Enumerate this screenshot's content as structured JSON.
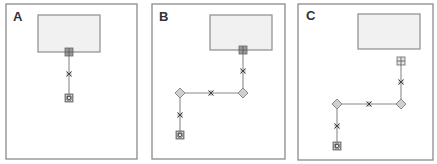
{
  "figure": {
    "panels": [
      {
        "label": "A",
        "description": "Shape with a single straight vertical connector",
        "border": {
          "x": 6,
          "y": 4,
          "w": 131,
          "h": 155
        },
        "shape": {
          "x": 38,
          "y": 15,
          "w": 62,
          "h": 37
        },
        "connector": {
          "start_handle": {
            "type": "grid-square",
            "x": 69,
            "y": 52
          },
          "waypoints": [],
          "midpoint_handles": [
            {
              "type": "x-mark",
              "x": 69,
              "y": 74
            }
          ],
          "end_handle": {
            "type": "target-square",
            "x": 69,
            "y": 98
          },
          "path": [
            [
              69,
              52
            ],
            [
              69,
              98
            ]
          ]
        }
      },
      {
        "label": "B",
        "description": "Connector rerouted with two bend points (elbow)",
        "border": {
          "x": 152,
          "y": 4,
          "w": 133,
          "h": 155
        },
        "shape": {
          "x": 210,
          "y": 15,
          "w": 62,
          "h": 35
        },
        "connector": {
          "start_handle": {
            "type": "grid-square",
            "x": 243,
            "y": 50
          },
          "waypoints": [
            {
              "type": "diamond",
              "x": 243,
              "y": 93
            },
            {
              "type": "diamond",
              "x": 180,
              "y": 93
            }
          ],
          "midpoint_handles": [
            {
              "type": "x-mark",
              "x": 243,
              "y": 71
            },
            {
              "type": "x-mark",
              "x": 211,
              "y": 93
            },
            {
              "type": "x-mark",
              "x": 180,
              "y": 115
            }
          ],
          "end_handle": {
            "type": "target-square",
            "x": 180,
            "y": 135
          },
          "path": [
            [
              243,
              50
            ],
            [
              243,
              93
            ],
            [
              180,
              93
            ],
            [
              180,
              135
            ]
          ]
        }
      },
      {
        "label": "C",
        "description": "Connector detached from the shape, start handle free-floating",
        "border": {
          "x": 298,
          "y": 4,
          "w": 135,
          "h": 156
        },
        "shape": {
          "x": 358,
          "y": 14,
          "w": 62,
          "h": 35
        },
        "connector": {
          "start_handle": {
            "type": "grid-square",
            "x": 401,
            "y": 61
          },
          "waypoints": [
            {
              "type": "diamond",
              "x": 401,
              "y": 104
            },
            {
              "type": "diamond",
              "x": 337,
              "y": 104
            }
          ],
          "midpoint_handles": [
            {
              "type": "x-mark",
              "x": 401,
              "y": 82
            },
            {
              "type": "x-mark",
              "x": 369,
              "y": 104
            },
            {
              "type": "x-mark",
              "x": 337,
              "y": 126
            }
          ],
          "end_handle": {
            "type": "target-square",
            "x": 337,
            "y": 146
          },
          "path": [
            [
              401,
              61
            ],
            [
              401,
              104
            ],
            [
              337,
              104
            ],
            [
              337,
              146
            ]
          ]
        }
      }
    ],
    "colors": {
      "border": "#8a8a8a",
      "shape_fill": "#f1f1f1",
      "handle_fill": "#9a9a9a",
      "diamond_fill": "#cfcfcf",
      "label": "#333333"
    }
  }
}
